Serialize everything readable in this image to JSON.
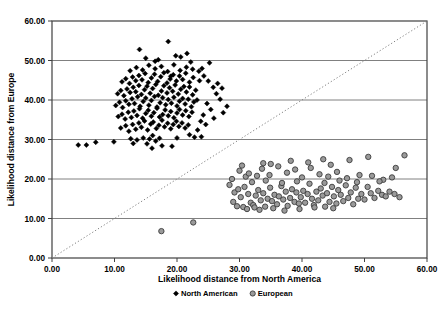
{
  "chart_data": {
    "type": "scatter",
    "title": "",
    "xlabel": "Likelihood distance from North America",
    "ylabel": "Likelihood distance from Europe",
    "xlim": [
      0,
      60
    ],
    "ylim": [
      0,
      60
    ],
    "xticks": [
      "0.00",
      "10.00",
      "20.00",
      "30.00",
      "40.00",
      "50.00",
      "60.00"
    ],
    "yticks": [
      "0.00",
      "10.00",
      "20.00",
      "30.00",
      "40.00",
      "50.00",
      "60.00"
    ],
    "xtick_values": [
      0,
      10,
      20,
      30,
      40,
      50,
      60
    ],
    "ytick_values": [
      0,
      10,
      20,
      30,
      40,
      50,
      60
    ],
    "grid": "horizontal",
    "legend_position": "bottom",
    "reference_line": {
      "name": "identity-line",
      "style": "dotted",
      "color": "#808080",
      "from": [
        0,
        0
      ],
      "to": [
        60,
        60
      ]
    },
    "series": [
      {
        "name": "North American",
        "marker": "diamond",
        "color": "#000000",
        "edge_color": "#000000",
        "points": [
          [
            4.2,
            28.6
          ],
          [
            5.5,
            28.6
          ],
          [
            7.0,
            29.3
          ],
          [
            9.9,
            29.4
          ],
          [
            12.6,
            30.2
          ],
          [
            13.6,
            29.9
          ],
          [
            14.6,
            30.4
          ],
          [
            15.2,
            28.9
          ],
          [
            15.6,
            30.1
          ],
          [
            16.1,
            31.0
          ],
          [
            16.6,
            29.6
          ],
          [
            17.2,
            30.3
          ],
          [
            17.6,
            28.4
          ],
          [
            20.0,
            30.4
          ],
          [
            22.8,
            30.6
          ],
          [
            11.0,
            32.9
          ],
          [
            11.8,
            33.5
          ],
          [
            12.3,
            32.1
          ],
          [
            12.9,
            33.8
          ],
          [
            13.4,
            32.6
          ],
          [
            13.9,
            34.2
          ],
          [
            14.3,
            33.1
          ],
          [
            14.8,
            34.7
          ],
          [
            15.3,
            32.4
          ],
          [
            15.8,
            33.9
          ],
          [
            16.2,
            34.4
          ],
          [
            16.7,
            32.8
          ],
          [
            17.1,
            33.6
          ],
          [
            17.6,
            34.9
          ],
          [
            18.0,
            33.2
          ],
          [
            18.5,
            34.1
          ],
          [
            19.0,
            32.7
          ],
          [
            19.4,
            33.8
          ],
          [
            19.9,
            34.6
          ],
          [
            20.3,
            33.3
          ],
          [
            20.8,
            34.2
          ],
          [
            21.3,
            32.9
          ],
          [
            21.8,
            33.7
          ],
          [
            10.6,
            35.8
          ],
          [
            11.2,
            36.4
          ],
          [
            11.7,
            35.2
          ],
          [
            12.2,
            36.9
          ],
          [
            12.7,
            35.6
          ],
          [
            13.1,
            37.2
          ],
          [
            13.6,
            36.1
          ],
          [
            14.0,
            37.8
          ],
          [
            14.5,
            35.4
          ],
          [
            15.0,
            36.6
          ],
          [
            15.4,
            37.4
          ],
          [
            15.9,
            35.9
          ],
          [
            16.3,
            36.8
          ],
          [
            16.8,
            37.9
          ],
          [
            17.2,
            35.7
          ],
          [
            17.7,
            36.3
          ],
          [
            18.1,
            37.5
          ],
          [
            18.6,
            36.0
          ],
          [
            19.0,
            37.1
          ],
          [
            19.5,
            35.5
          ],
          [
            20.0,
            36.7
          ],
          [
            20.4,
            37.6
          ],
          [
            20.9,
            36.2
          ],
          [
            21.4,
            37.3
          ],
          [
            21.9,
            35.8
          ],
          [
            22.4,
            36.9
          ],
          [
            10.2,
            38.6
          ],
          [
            10.8,
            39.4
          ],
          [
            11.3,
            38.1
          ],
          [
            11.8,
            39.8
          ],
          [
            12.3,
            38.9
          ],
          [
            12.8,
            40.3
          ],
          [
            13.2,
            39.1
          ],
          [
            13.7,
            40.8
          ],
          [
            14.1,
            38.4
          ],
          [
            14.6,
            39.6
          ],
          [
            15.0,
            40.5
          ],
          [
            15.5,
            38.7
          ],
          [
            15.9,
            39.9
          ],
          [
            16.4,
            40.9
          ],
          [
            16.8,
            38.2
          ],
          [
            17.3,
            39.3
          ],
          [
            17.7,
            40.6
          ],
          [
            18.2,
            38.8
          ],
          [
            18.6,
            40.1
          ],
          [
            19.1,
            39.2
          ],
          [
            19.5,
            40.7
          ],
          [
            20.0,
            38.5
          ],
          [
            20.4,
            39.7
          ],
          [
            20.9,
            40.4
          ],
          [
            21.3,
            39.0
          ],
          [
            21.8,
            40.2
          ],
          [
            22.3,
            38.3
          ],
          [
            22.7,
            39.5
          ],
          [
            23.2,
            40.0
          ],
          [
            10.5,
            41.6
          ],
          [
            11.0,
            42.4
          ],
          [
            11.5,
            41.1
          ],
          [
            12.0,
            42.8
          ],
          [
            12.5,
            41.9
          ],
          [
            13.0,
            43.2
          ],
          [
            13.4,
            42.1
          ],
          [
            13.9,
            43.7
          ],
          [
            14.3,
            41.4
          ],
          [
            14.8,
            42.6
          ],
          [
            15.2,
            43.5
          ],
          [
            15.7,
            41.7
          ],
          [
            16.1,
            42.9
          ],
          [
            16.6,
            43.9
          ],
          [
            17.0,
            41.2
          ],
          [
            17.5,
            42.3
          ],
          [
            17.9,
            43.6
          ],
          [
            18.4,
            41.8
          ],
          [
            18.8,
            43.1
          ],
          [
            19.3,
            42.2
          ],
          [
            19.7,
            43.8
          ],
          [
            20.2,
            41.5
          ],
          [
            20.6,
            42.7
          ],
          [
            21.1,
            43.4
          ],
          [
            21.5,
            42.0
          ],
          [
            22.0,
            43.3
          ],
          [
            22.5,
            41.3
          ],
          [
            23.0,
            42.5
          ],
          [
            11.2,
            44.6
          ],
          [
            11.8,
            45.4
          ],
          [
            12.4,
            44.2
          ],
          [
            12.9,
            45.8
          ],
          [
            13.4,
            44.9
          ],
          [
            13.9,
            46.2
          ],
          [
            14.4,
            45.1
          ],
          [
            14.9,
            46.7
          ],
          [
            15.4,
            44.4
          ],
          [
            15.9,
            45.6
          ],
          [
            16.4,
            46.5
          ],
          [
            16.9,
            44.7
          ],
          [
            17.4,
            45.9
          ],
          [
            17.9,
            46.9
          ],
          [
            18.4,
            44.3
          ],
          [
            18.9,
            45.3
          ],
          [
            19.4,
            46.4
          ],
          [
            19.9,
            44.8
          ],
          [
            20.4,
            46.1
          ],
          [
            20.9,
            45.2
          ],
          [
            21.4,
            46.8
          ],
          [
            22.0,
            44.5
          ],
          [
            22.6,
            45.7
          ],
          [
            12.5,
            47.4
          ],
          [
            13.5,
            48.2
          ],
          [
            14.5,
            47.6
          ],
          [
            15.5,
            48.8
          ],
          [
            16.5,
            47.9
          ],
          [
            17.5,
            48.5
          ],
          [
            18.5,
            47.2
          ],
          [
            19.5,
            48.9
          ],
          [
            20.5,
            47.5
          ],
          [
            21.5,
            48.3
          ],
          [
            22.5,
            47.8
          ],
          [
            14.0,
            52.8
          ],
          [
            15.0,
            50.6
          ],
          [
            16.5,
            49.8
          ],
          [
            17.0,
            50.2
          ],
          [
            18.6,
            54.8
          ],
          [
            19.8,
            51.2
          ],
          [
            20.6,
            50.9
          ],
          [
            21.6,
            51.8
          ],
          [
            23.5,
            47.3
          ],
          [
            24.3,
            46.1
          ],
          [
            25.0,
            44.8
          ],
          [
            25.8,
            43.2
          ],
          [
            26.3,
            41.6
          ],
          [
            26.9,
            40.2
          ],
          [
            24.8,
            39.1
          ],
          [
            25.4,
            37.6
          ],
          [
            24.2,
            36.2
          ],
          [
            25.9,
            35.4
          ],
          [
            23.8,
            34.6
          ],
          [
            24.6,
            33.8
          ],
          [
            23.3,
            32.4
          ],
          [
            22.0,
            31.2
          ],
          [
            23.9,
            30.7
          ],
          [
            19.2,
            28.3
          ],
          [
            16.0,
            27.8
          ],
          [
            27.4,
            36.8
          ],
          [
            28.0,
            38.4
          ],
          [
            26.5,
            44.2
          ],
          [
            27.2,
            43.0
          ],
          [
            23.6,
            44.9
          ],
          [
            24.0,
            48.0
          ],
          [
            25.2,
            49.4
          ],
          [
            22.2,
            49.6
          ],
          [
            19.0,
            46.0
          ],
          [
            13.0,
            29.0
          ]
        ]
      },
      {
        "name": "European",
        "marker": "circle",
        "color": "#9a9a9a",
        "edge_color": "#3c3c3c",
        "points": [
          [
            17.5,
            6.8
          ],
          [
            22.6,
            9.0
          ],
          [
            28.4,
            18.5
          ],
          [
            29.0,
            14.2
          ],
          [
            29.6,
            13.1
          ],
          [
            30.2,
            15.4
          ],
          [
            30.6,
            12.9
          ],
          [
            31.0,
            20.6
          ],
          [
            31.4,
            16.2
          ],
          [
            31.8,
            14.0
          ],
          [
            32.2,
            13.4
          ],
          [
            32.6,
            15.8
          ],
          [
            33.0,
            17.2
          ],
          [
            33.4,
            14.6
          ],
          [
            33.8,
            16.4
          ],
          [
            34.1,
            13.0
          ],
          [
            34.5,
            15.0
          ],
          [
            34.9,
            17.8
          ],
          [
            35.2,
            14.4
          ],
          [
            35.6,
            16.0
          ],
          [
            36.0,
            13.6
          ],
          [
            36.3,
            15.6
          ],
          [
            36.7,
            18.2
          ],
          [
            37.0,
            14.8
          ],
          [
            37.4,
            16.8
          ],
          [
            37.7,
            13.2
          ],
          [
            38.1,
            15.2
          ],
          [
            38.4,
            17.4
          ],
          [
            38.8,
            14.2
          ],
          [
            39.1,
            16.6
          ],
          [
            39.5,
            13.8
          ],
          [
            39.8,
            15.4
          ],
          [
            40.2,
            17.0
          ],
          [
            40.5,
            14.0
          ],
          [
            40.9,
            16.2
          ],
          [
            41.2,
            18.8
          ],
          [
            41.6,
            15.0
          ],
          [
            41.9,
            13.4
          ],
          [
            42.3,
            16.8
          ],
          [
            42.6,
            14.6
          ],
          [
            43.0,
            17.6
          ],
          [
            43.3,
            15.8
          ],
          [
            43.7,
            13.0
          ],
          [
            44.0,
            16.4
          ],
          [
            44.4,
            14.2
          ],
          [
            44.8,
            18.0
          ],
          [
            45.1,
            15.6
          ],
          [
            45.5,
            13.8
          ],
          [
            45.8,
            17.2
          ],
          [
            46.2,
            16.0
          ],
          [
            46.6,
            14.4
          ],
          [
            47.0,
            18.4
          ],
          [
            47.4,
            15.2
          ],
          [
            47.8,
            16.6
          ],
          [
            48.2,
            13.6
          ],
          [
            48.6,
            17.8
          ],
          [
            49.0,
            15.0
          ],
          [
            49.5,
            16.2
          ],
          [
            50.0,
            14.8
          ],
          [
            50.5,
            18.0
          ],
          [
            51.0,
            16.4
          ],
          [
            51.6,
            15.2
          ],
          [
            52.2,
            17.0
          ],
          [
            52.8,
            16.0
          ],
          [
            53.4,
            15.6
          ],
          [
            54.0,
            16.8
          ],
          [
            54.8,
            16.2
          ],
          [
            55.6,
            15.4
          ],
          [
            30.0,
            22.1
          ],
          [
            31.5,
            21.4
          ],
          [
            32.8,
            20.8
          ],
          [
            33.6,
            22.6
          ],
          [
            34.8,
            21.0
          ],
          [
            36.2,
            23.2
          ],
          [
            37.6,
            21.6
          ],
          [
            38.9,
            22.4
          ],
          [
            40.0,
            20.4
          ],
          [
            41.4,
            22.8
          ],
          [
            42.8,
            21.2
          ],
          [
            44.2,
            20.6
          ],
          [
            45.6,
            21.8
          ],
          [
            47.2,
            20.2
          ],
          [
            49.2,
            21.0
          ],
          [
            51.2,
            20.8
          ],
          [
            53.0,
            19.8
          ],
          [
            54.4,
            20.4
          ],
          [
            56.4,
            26.0
          ],
          [
            50.6,
            25.6
          ],
          [
            47.6,
            24.8
          ],
          [
            44.6,
            23.6
          ],
          [
            41.0,
            24.2
          ],
          [
            38.2,
            24.6
          ],
          [
            35.0,
            23.8
          ],
          [
            32.0,
            19.2
          ],
          [
            30.8,
            18.0
          ],
          [
            34.2,
            19.6
          ],
          [
            36.8,
            19.0
          ],
          [
            39.2,
            19.4
          ],
          [
            43.6,
            19.0
          ],
          [
            46.0,
            19.6
          ],
          [
            48.8,
            19.2
          ],
          [
            52.4,
            19.4
          ],
          [
            29.2,
            16.6
          ],
          [
            29.8,
            17.4
          ],
          [
            31.2,
            12.4
          ],
          [
            32.4,
            12.8
          ],
          [
            33.2,
            12.2
          ],
          [
            35.4,
            12.6
          ],
          [
            37.2,
            12.0
          ],
          [
            39.6,
            12.4
          ],
          [
            42.0,
            12.8
          ],
          [
            45.0,
            12.6
          ],
          [
            28.8,
            20.0
          ],
          [
            30.4,
            23.4
          ],
          [
            33.8,
            24.0
          ],
          [
            43.4,
            25.0
          ],
          [
            55.0,
            22.8
          ]
        ]
      }
    ]
  },
  "legend": {
    "items": [
      {
        "label": "North American",
        "marker": "diamond"
      },
      {
        "label": "European",
        "marker": "circle"
      }
    ]
  }
}
